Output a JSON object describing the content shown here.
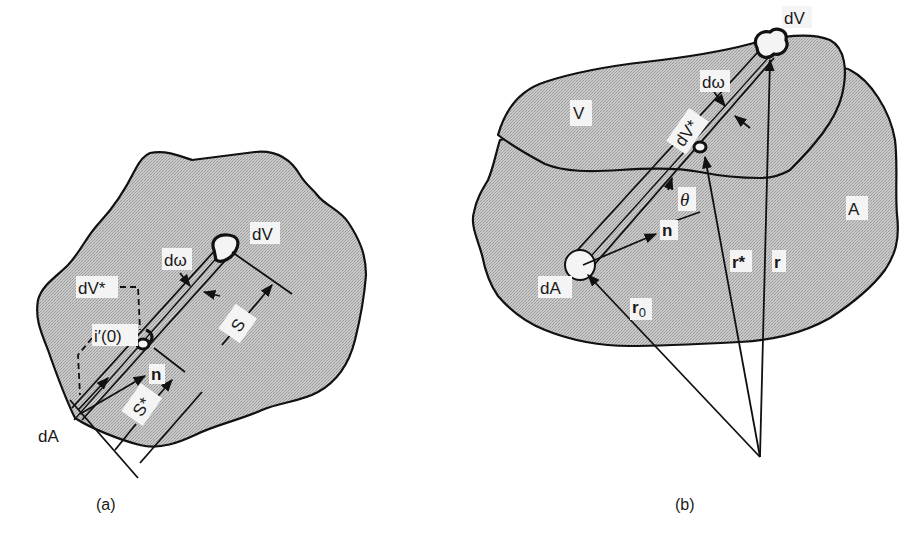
{
  "figure": {
    "panels": [
      {
        "id": "a",
        "caption": "(a)",
        "labels": {
          "dV": "dV",
          "d_omega": "dω",
          "dV_star": "dV*",
          "i_prime_0": "i′(0)",
          "n": "n",
          "S": "S",
          "S_star": "S*",
          "dA": "dA"
        }
      },
      {
        "id": "b",
        "caption": "(b)",
        "labels": {
          "dV": "dV",
          "d_omega": "dω",
          "V": "V",
          "dV_star": "dV*",
          "theta": "θ",
          "n": "n",
          "A": "A",
          "dA": "dA",
          "r0_base": "r",
          "r0_sub": "0",
          "r_star": "r*",
          "r": "r"
        }
      }
    ],
    "colors": {
      "fill_gray": "#bdbdbd",
      "stroke": "#111111",
      "background": "#ffffff"
    }
  }
}
